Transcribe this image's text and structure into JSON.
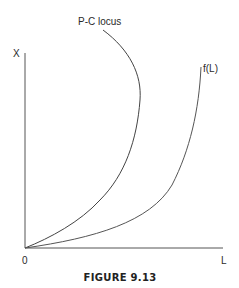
{
  "figure": {
    "caption": "FIGURE 9.13",
    "axes": {
      "y_label": "X",
      "x_label": "L",
      "origin_label": "0"
    },
    "curves": [
      {
        "name": "pc-locus",
        "label": "P-C locus",
        "shape": "backward-bending, convex from origin"
      },
      {
        "name": "f-of-l",
        "label": "f(L)",
        "shape": "convex increasing from origin"
      }
    ],
    "colors": {
      "line": "#4a4a4a",
      "text": "#2a2a2a"
    }
  }
}
